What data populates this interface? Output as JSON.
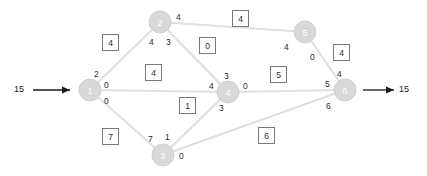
{
  "diagram": {
    "source_inflow": "15",
    "sink_outflow": "15",
    "node_fill": "#d9d9d9",
    "edge_color": "#e0e0e0",
    "box_border": "#7a7a7a",
    "nodes": [
      {
        "id": "1",
        "label": "1",
        "cx": 90,
        "cy": 90,
        "r": 11
      },
      {
        "id": "2",
        "label": "2",
        "cx": 160,
        "cy": 22,
        "r": 11
      },
      {
        "id": "3",
        "label": "3",
        "cx": 163,
        "cy": 155,
        "r": 11
      },
      {
        "id": "4",
        "label": "4",
        "cx": 228,
        "cy": 92,
        "r": 11
      },
      {
        "id": "5",
        "label": "5",
        "cx": 305,
        "cy": 32,
        "r": 11
      },
      {
        "id": "6",
        "label": "6",
        "cx": 345,
        "cy": 90,
        "r": 11
      }
    ],
    "edges": [
      {
        "id": "e1-2",
        "from": "1",
        "to": "2",
        "capacity": "4",
        "tail_flow": "2",
        "head_flow": "4"
      },
      {
        "id": "e1-4",
        "from": "1",
        "to": "4",
        "capacity": "4",
        "tail_flow": "0",
        "head_flow": "4"
      },
      {
        "id": "e1-3",
        "from": "1",
        "to": "3",
        "capacity": "7",
        "tail_flow": "0",
        "head_flow": "7"
      },
      {
        "id": "e2-5",
        "from": "2",
        "to": "5",
        "capacity": "4",
        "tail_flow": "4",
        "head_flow": "4"
      },
      {
        "id": "e2-4",
        "from": "2",
        "to": "4",
        "capacity": "0",
        "tail_flow": "3",
        "head_flow": "3"
      },
      {
        "id": "e3-4",
        "from": "3",
        "to": "4",
        "capacity": "1",
        "tail_flow": "1",
        "head_flow": "3"
      },
      {
        "id": "e3-6",
        "from": "3",
        "to": "6",
        "capacity": "6",
        "tail_flow": "0",
        "head_flow": "6"
      },
      {
        "id": "e4-6",
        "from": "4",
        "to": "6",
        "capacity": "5",
        "tail_flow": "0",
        "head_flow": "5"
      },
      {
        "id": "e5-6",
        "from": "5",
        "to": "6",
        "capacity": "4",
        "tail_flow": "0",
        "head_flow": "4"
      }
    ],
    "flow_labels": [
      {
        "id": "f-n1-up",
        "text": "2",
        "x": 94,
        "y": 70
      },
      {
        "id": "f-n1-mid",
        "text": "0",
        "x": 104,
        "y": 81
      },
      {
        "id": "f-n1-low",
        "text": "0",
        "x": 104,
        "y": 97
      },
      {
        "id": "f-n2-right",
        "text": "4",
        "x": 176,
        "y": 13
      },
      {
        "id": "f-n2-ll",
        "text": "4",
        "x": 149,
        "y": 38
      },
      {
        "id": "f-n2-lr",
        "text": "3",
        "x": 166,
        "y": 38
      },
      {
        "id": "f-n4-up",
        "text": "3",
        "x": 224,
        "y": 72
      },
      {
        "id": "f-n4-left",
        "text": "4",
        "x": 209,
        "y": 82
      },
      {
        "id": "f-n4-right",
        "text": "0",
        "x": 243,
        "y": 82
      },
      {
        "id": "f-n4-low",
        "text": "3",
        "x": 219,
        "y": 104
      },
      {
        "id": "f-n3-ul",
        "text": "7",
        "x": 148,
        "y": 135
      },
      {
        "id": "f-n3-ur",
        "text": "1",
        "x": 165,
        "y": 133
      },
      {
        "id": "f-n3-right",
        "text": "0",
        "x": 179,
        "y": 152
      },
      {
        "id": "f-n5-left",
        "text": "4",
        "x": 284,
        "y": 43
      },
      {
        "id": "f-n5-low",
        "text": "0",
        "x": 310,
        "y": 53
      },
      {
        "id": "f-n6-up",
        "text": "4",
        "x": 337,
        "y": 70
      },
      {
        "id": "f-n6-left",
        "text": "5",
        "x": 325,
        "y": 80
      },
      {
        "id": "f-n6-low",
        "text": "6",
        "x": 326,
        "y": 102
      }
    ],
    "capacity_boxes": [
      {
        "id": "cap-1-2",
        "value": "4",
        "x": 102,
        "y": 34
      },
      {
        "id": "cap-2-5",
        "value": "4",
        "x": 232,
        "y": 10
      },
      {
        "id": "cap-2-4",
        "value": "0",
        "x": 199,
        "y": 37
      },
      {
        "id": "cap-1-4",
        "value": "4",
        "x": 145,
        "y": 64
      },
      {
        "id": "cap-4-6",
        "value": "5",
        "x": 270,
        "y": 66
      },
      {
        "id": "cap-5-6",
        "value": "4",
        "x": 333,
        "y": 44
      },
      {
        "id": "cap-3-4",
        "value": "1",
        "x": 179,
        "y": 97
      },
      {
        "id": "cap-1-3",
        "value": "7",
        "x": 102,
        "y": 128
      },
      {
        "id": "cap-3-6",
        "value": "6",
        "x": 258,
        "y": 127
      }
    ],
    "io": {
      "in_label": {
        "text": "15",
        "x": 14,
        "y": 85
      },
      "out_label": {
        "text": "15",
        "x": 399,
        "y": 85
      }
    }
  }
}
